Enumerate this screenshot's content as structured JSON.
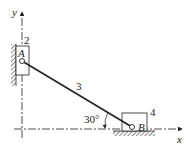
{
  "diagram": {
    "type": "slider-crank mechanism (elliptical trammel)",
    "axes": {
      "x_label": "x",
      "y_label": "y"
    },
    "links": {
      "slider_vertical": "2",
      "connecting_rod": "3",
      "slider_horizontal": "4"
    },
    "joints": {
      "upper": "A",
      "lower": "B"
    },
    "angle": {
      "label": "30°",
      "value_deg": 30
    },
    "colors": {
      "line": "#222222",
      "hatch": "#555555",
      "background": "#ffffff"
    }
  }
}
